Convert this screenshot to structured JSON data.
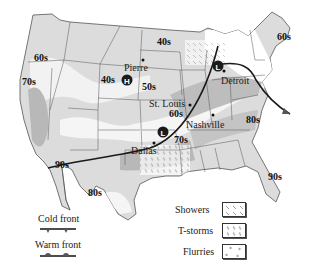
{
  "map": {
    "title": "",
    "region": "Contiguous United States",
    "colors": {
      "land_light": "#e6e6e6",
      "land_mid": "#c8c8c8",
      "land_dark": "#a9a9a9",
      "warm_band": "#f4f4f4",
      "border": "#444444",
      "front_line": "#1a1a1a",
      "pressure_symbol": "#1a1a1a"
    },
    "temperature_labels": [
      {
        "id": "t60s-nw",
        "text": "60s"
      },
      {
        "id": "t70s-ca",
        "text": "70s"
      },
      {
        "id": "t40s-wy",
        "text": "40s"
      },
      {
        "id": "t40s-nd",
        "text": "40s"
      },
      {
        "id": "t50s-ne",
        "text": "50s"
      },
      {
        "id": "t60s-ne",
        "text": "60s"
      },
      {
        "id": "t90s-az",
        "text": "90s"
      },
      {
        "id": "t80s-tx",
        "text": "80s"
      },
      {
        "id": "t60s-mo",
        "text": "60s"
      },
      {
        "id": "t70s-ar",
        "text": "70s"
      },
      {
        "id": "t80s-nc",
        "text": "80s"
      },
      {
        "id": "t90s-fl",
        "text": "90s"
      }
    ],
    "cities": [
      {
        "name": "Pierre"
      },
      {
        "name": "St. Louis"
      },
      {
        "name": "Detroit"
      },
      {
        "name": "Nashville"
      },
      {
        "name": "Dallas"
      }
    ],
    "pressure_centers": [
      {
        "type": "high",
        "symbol": "H",
        "location": "near Pierre"
      },
      {
        "type": "low",
        "symbol": "L",
        "location": "near Detroit"
      },
      {
        "type": "low",
        "symbol": "L",
        "location": "near Dallas"
      }
    ]
  },
  "legend": {
    "fronts": [
      {
        "label": "Cold front",
        "icon": "cold-front-icon"
      },
      {
        "label": "Warm front",
        "icon": "warm-front-icon"
      }
    ],
    "precipitation": [
      {
        "label": "Showers",
        "icon": "showers-pattern-icon"
      },
      {
        "label": "T-storms",
        "icon": "tstorms-pattern-icon"
      },
      {
        "label": "Flurries",
        "icon": "flurries-pattern-icon"
      }
    ]
  }
}
